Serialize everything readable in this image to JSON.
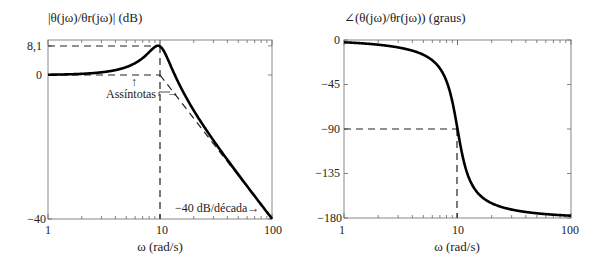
{
  "chart_data": [
    {
      "type": "line",
      "title": "|θ(jω)/θr(jω)| (dB)",
      "xlabel": "ω (rad/s)",
      "ylabel": "",
      "xscale": "log",
      "xlim": [
        1,
        100
      ],
      "ylim": [
        -40,
        8.1
      ],
      "xticks": [
        "1",
        "10",
        "100"
      ],
      "yticks": [
        "−40",
        "0",
        "8,1"
      ],
      "ytick_values": [
        -40,
        0,
        8.1
      ],
      "grid": false,
      "system": {
        "wn": 10,
        "zeta": 0.2
      },
      "series": [
        {
          "name": "magnitude",
          "style": "solid",
          "x": [
            1,
            2,
            4,
            6,
            8,
            9,
            10,
            12,
            15,
            20,
            30,
            50,
            100
          ],
          "y": [
            0.1,
            0.3,
            1.3,
            3.2,
            6.6,
            7.7,
            8.0,
            4.1,
            -3.9,
            -9.6,
            -18.0,
            -27.8,
            -39.9
          ]
        },
        {
          "name": "asymptote-low",
          "style": "dashed",
          "x": [
            1,
            10
          ],
          "y": [
            0,
            0
          ]
        },
        {
          "name": "asymptote-high",
          "style": "dashed",
          "x": [
            10,
            100
          ],
          "y": [
            0,
            -40
          ]
        }
      ],
      "reference_lines": [
        {
          "style": "dashed",
          "from": [
            1,
            8.1
          ],
          "to": [
            10,
            8.1
          ]
        },
        {
          "style": "dashed",
          "from": [
            10,
            8.1
          ],
          "to": [
            10,
            -40
          ]
        }
      ],
      "annotations": [
        {
          "text": "Assíntotas",
          "arrows": [
            "up",
            "right"
          ]
        },
        {
          "text": "−40 dB/década→"
        }
      ]
    },
    {
      "type": "line",
      "title": "∠(θ(jω)/θr(jω)) (graus)",
      "xlabel": "ω (rad/s)",
      "ylabel": "",
      "xscale": "log",
      "xlim": [
        1,
        100
      ],
      "ylim": [
        -180,
        0
      ],
      "xticks": [
        "1",
        "10",
        "100"
      ],
      "yticks": [
        "0",
        "−45",
        "−90",
        "−135",
        "−180"
      ],
      "ytick_values": [
        0,
        -45,
        -90,
        -135,
        -180
      ],
      "grid": false,
      "system": {
        "wn": 10,
        "zeta": 0.2
      },
      "series": [
        {
          "name": "phase",
          "style": "solid",
          "x": [
            1,
            2,
            4,
            6,
            8,
            9,
            10,
            11,
            12,
            15,
            20,
            30,
            50,
            100
          ],
          "y": [
            -2.3,
            -4.8,
            -10.8,
            -20.6,
            -41.6,
            -62.3,
            -90,
            -115,
            -132.4,
            -154.4,
            -165.1,
            -171.5,
            -175.2,
            -177.7
          ]
        }
      ],
      "reference_lines": [
        {
          "style": "dashed",
          "from": [
            1,
            -90
          ],
          "to": [
            10,
            -90
          ]
        },
        {
          "style": "dashed",
          "from": [
            10,
            -90
          ],
          "to": [
            10,
            -180
          ]
        }
      ]
    }
  ]
}
